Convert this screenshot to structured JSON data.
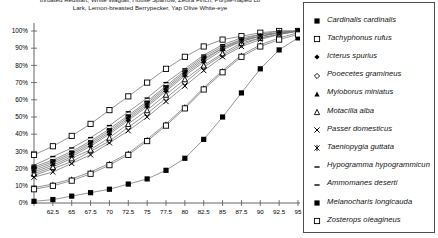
{
  "caption": {
    "text": "throated Redstart, White Wagtail, House Sparrow, Zebra Finch, Purple-naped Lo\nLark, Lemon-breasted Berrypecker, Yap Olive White-eye"
  },
  "legend": {
    "entries": [
      {
        "label": "Cardinalis cardinalis",
        "marker": "filled-square-marker"
      },
      {
        "label": "Tachyphonus rufus",
        "marker": "open-square-marker"
      },
      {
        "label": "Icterus spurius",
        "marker": "filled-diamond-marker"
      },
      {
        "label": "Pooecetes gramineus",
        "marker": "open-diamond-marker"
      },
      {
        "label": "Myioborus miniatus",
        "marker": "filled-triangle-marker"
      },
      {
        "label": "Motacilla alba",
        "marker": "open-triangle-marker"
      },
      {
        "label": "Passer domesticus",
        "marker": "x-cross-marker"
      },
      {
        "label": "Taeniopygia guttata",
        "marker": "asterisk-marker"
      },
      {
        "label": "Hypogramma hypogrammicun",
        "marker": "dash-dot-line-marker"
      },
      {
        "label": "Ammomanes deserti",
        "marker": "dash-line-marker"
      },
      {
        "label": "Melanocharis longicauda",
        "marker": "filled-square-marker"
      },
      {
        "label": "Zosterops oleagineus",
        "marker": "open-square-marker"
      }
    ]
  },
  "chart_data": {
    "type": "line",
    "title": "",
    "xlabel": "",
    "ylabel": "",
    "xlim": [
      60,
      95
    ],
    "ylim": [
      0,
      100
    ],
    "grid": false,
    "legend_position": "right",
    "x": [
      60,
      62.5,
      65,
      67.5,
      70,
      72.5,
      75,
      77.5,
      80,
      82.5,
      85,
      87.5,
      90,
      92.5,
      95
    ],
    "xticks": [
      "",
      "62.5",
      "65",
      "67.5",
      "70",
      "72.5",
      "75",
      "77.5",
      "80",
      "82.5",
      "85",
      "87.5",
      "90",
      "92.5",
      "95"
    ],
    "yticks": [
      "0%",
      "10%",
      "20%",
      "30%",
      "40%",
      "50%",
      "60%",
      "70%",
      "80%",
      "90%",
      "100%"
    ],
    "series": [
      {
        "name": "Cardinalis cardinalis",
        "marker": "filled-square-marker",
        "values": [
          20,
          24,
          29,
          35,
          42,
          50,
          58,
          67,
          76,
          84,
          90,
          95,
          97,
          99,
          100
        ]
      },
      {
        "name": "Tachyphonus rufus",
        "marker": "open-square-marker",
        "values": [
          28,
          33,
          39,
          46,
          54,
          62,
          70,
          78,
          85,
          91,
          95,
          97,
          99,
          100,
          100
        ]
      },
      {
        "name": "Icterus spurius",
        "marker": "filled-diamond-marker",
        "values": [
          18,
          22,
          27,
          33,
          40,
          48,
          56,
          65,
          74,
          82,
          89,
          94,
          97,
          99,
          100
        ]
      },
      {
        "name": "Pooecetes gramineus",
        "marker": "open-diamond-marker",
        "values": [
          16,
          20,
          24,
          30,
          36,
          44,
          52,
          61,
          70,
          79,
          86,
          92,
          96,
          98,
          100
        ]
      },
      {
        "name": "Myioborus miniatus",
        "marker": "filled-triangle-marker",
        "values": [
          9,
          11,
          14,
          18,
          23,
          29,
          37,
          46,
          56,
          67,
          77,
          86,
          92,
          96,
          99
        ]
      },
      {
        "name": "Motacilla alba",
        "marker": "open-triangle-marker",
        "values": [
          17,
          21,
          26,
          31,
          38,
          46,
          54,
          63,
          72,
          80,
          87,
          93,
          96,
          98,
          100
        ]
      },
      {
        "name": "Passer domesticus",
        "marker": "x-cross-marker",
        "values": [
          15,
          18,
          23,
          28,
          35,
          42,
          50,
          59,
          68,
          77,
          85,
          91,
          95,
          98,
          100
        ]
      },
      {
        "name": "Taeniopygia guttata",
        "marker": "asterisk-marker",
        "values": [
          19,
          23,
          28,
          34,
          41,
          49,
          57,
          66,
          75,
          83,
          90,
          94,
          97,
          99,
          100
        ]
      },
      {
        "name": "Hypogramma hypogrammicun",
        "marker": "dash-dot-line-marker",
        "values": [
          21,
          25,
          30,
          36,
          43,
          51,
          59,
          68,
          77,
          85,
          91,
          95,
          98,
          99,
          100
        ]
      },
      {
        "name": "Ammomanes deserti",
        "marker": "dash-line-marker",
        "values": [
          22,
          27,
          32,
          38,
          45,
          53,
          61,
          70,
          78,
          86,
          92,
          96,
          98,
          100,
          100
        ]
      },
      {
        "name": "Melanocharis longicauda",
        "marker": "filled-square-marker",
        "values": [
          1,
          2,
          4,
          6,
          8,
          11,
          14,
          19,
          26,
          37,
          50,
          64,
          78,
          89,
          96
        ]
      },
      {
        "name": "Zosterops oleagineus",
        "marker": "open-square-marker",
        "values": [
          8,
          10,
          13,
          17,
          22,
          28,
          36,
          45,
          55,
          66,
          76,
          85,
          91,
          95,
          98
        ]
      }
    ]
  }
}
